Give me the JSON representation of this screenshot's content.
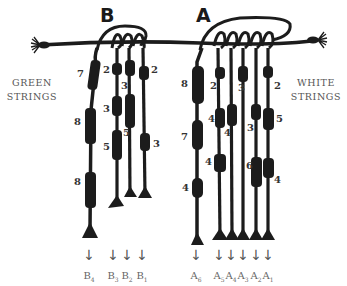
{
  "labels": {
    "left_side": [
      "GREEN",
      "STRINGS"
    ],
    "right_side": [
      "WHITE",
      "STRINGS"
    ],
    "group_b": "B",
    "group_a": "A"
  },
  "colors": {
    "string": "#1c1c1c",
    "text": "#333333",
    "side_text": "#555555"
  },
  "groups": [
    {
      "name": "B",
      "color_label": "GREEN STRINGS",
      "strings": [
        {
          "id": "B4",
          "letter": "B",
          "index": "4",
          "knot_counts": [
            "7",
            "8",
            "8"
          ]
        },
        {
          "id": "B3",
          "letter": "B",
          "index": "3",
          "knot_counts": [
            "2",
            "3",
            "5"
          ]
        },
        {
          "id": "B2",
          "letter": "B",
          "index": "2",
          "knot_counts": [
            "3",
            "5"
          ]
        },
        {
          "id": "B1",
          "letter": "B",
          "index": "1",
          "knot_counts": [
            "2",
            "3"
          ]
        }
      ]
    },
    {
      "name": "A",
      "color_label": "WHITE STRINGS",
      "strings": [
        {
          "id": "A6",
          "letter": "A",
          "index": "6",
          "knot_counts": [
            "8",
            "7",
            "4"
          ]
        },
        {
          "id": "A5",
          "letter": "A",
          "index": "5",
          "knot_counts": [
            "2",
            "4",
            "4"
          ]
        },
        {
          "id": "A4",
          "letter": "A",
          "index": "4",
          "knot_counts": [
            "4"
          ]
        },
        {
          "id": "A3",
          "letter": "A",
          "index": "3",
          "knot_counts": [
            "3"
          ]
        },
        {
          "id": "A2",
          "letter": "A",
          "index": "2",
          "knot_counts": [
            "3",
            "6"
          ]
        },
        {
          "id": "A1",
          "letter": "A",
          "index": "1",
          "knot_counts": [
            "2",
            "5",
            "4"
          ]
        }
      ]
    }
  ],
  "counts": {
    "b4_1": "7",
    "b4_2": "8",
    "b4_3": "8",
    "b3_1": "2",
    "b3_2": "3",
    "b3_3": "5",
    "b2_1": "3",
    "b2_2": "5",
    "b1_1": "2",
    "b1_2": "3",
    "a6_1": "8",
    "a6_2": "7",
    "a6_3": "4",
    "a5_1": "2",
    "a5_2": "4",
    "a5_3": "4",
    "a4_1": "4",
    "a3_1": "3",
    "a2_1": "3",
    "a2_2": "6",
    "a1_1": "2",
    "a1_2": "5",
    "a1_3": "4"
  },
  "endpoints": {
    "b4": {
      "letter": "B",
      "index": "4"
    },
    "b3": {
      "letter": "B",
      "index": "3"
    },
    "b2": {
      "letter": "B",
      "index": "2"
    },
    "b1": {
      "letter": "B",
      "index": "1"
    },
    "a6": {
      "letter": "A",
      "index": "6"
    },
    "a5": {
      "letter": "A",
      "index": "5"
    },
    "a4": {
      "letter": "A",
      "index": "4"
    },
    "a3": {
      "letter": "A",
      "index": "3"
    },
    "a2": {
      "letter": "A",
      "index": "2"
    },
    "a1": {
      "letter": "A",
      "index": "1"
    }
  },
  "arrow_glyph": "↓"
}
